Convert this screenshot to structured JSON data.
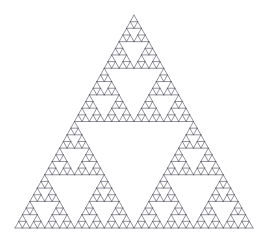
{
  "figure": {
    "kind": "fractal-line-drawing",
    "background_color": "#ffffff",
    "canvas": {
      "width": 267,
      "height": 238
    }
  },
  "chart_data": {
    "type": "diagram",
    "subtype": "sierpinski-triangle",
    "subtitle": "",
    "xlabel": "",
    "ylabel": "",
    "legend": [],
    "annotations": [],
    "grid": false,
    "axes_visible": false,
    "tick_labels": [],
    "geometry": {
      "outer_triangle_vertices": [
        {
          "name": "apex",
          "x": 134,
          "y": 15
        },
        {
          "name": "bottom-left",
          "x": 15,
          "y": 228
        },
        {
          "name": "bottom-right",
          "x": 253,
          "y": 228
        }
      ],
      "base_width_px": 238,
      "height_px": 213,
      "recursion_depth": 4,
      "cells_per_edge": 16,
      "smallest_cell_subdivided": true,
      "smallest_cell_edge_px": 14.875,
      "total_solid_cells": 81,
      "largest_hole_count": 1,
      "orientation": "apex-up"
    },
    "style": {
      "stroke_color": "#4a4a55",
      "stroke_width_px": 0.6,
      "fill": "none",
      "background_color": "#ffffff"
    }
  }
}
